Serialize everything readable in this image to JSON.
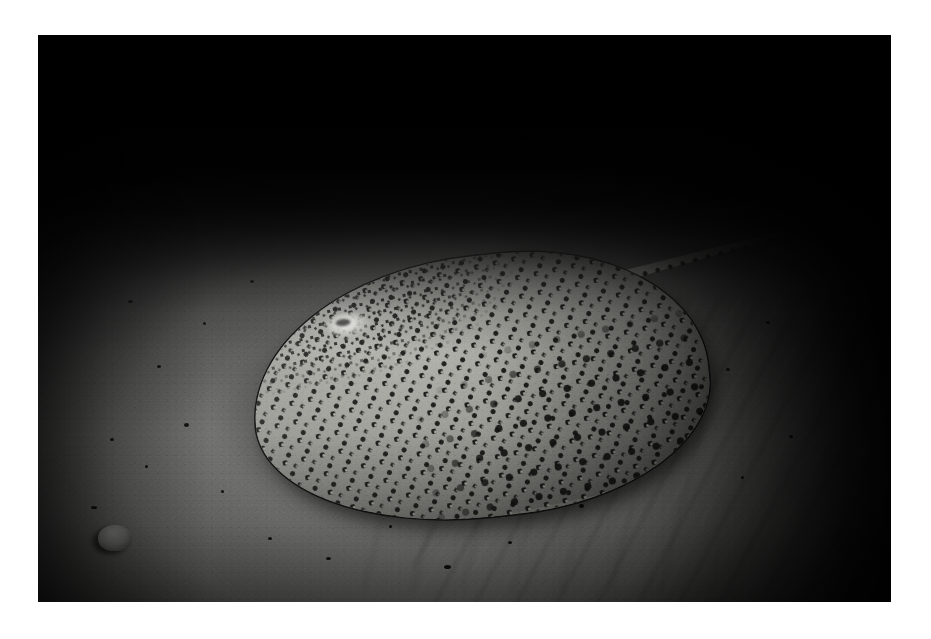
{
  "image": {
    "domain": "Natural-Image",
    "subject": "leopard whipray (honeycomb stingray) resting on sandy seabed",
    "scene": "underwater night photograph illuminated by strobe flash",
    "orientation": "landscape",
    "frame": {
      "canvas_width": 931,
      "canvas_height": 639,
      "border_color": "#ffffff",
      "photo_left": 38,
      "photo_top": 35,
      "photo_width": 853,
      "photo_height": 567
    },
    "palette": {
      "border": "#ffffff",
      "water_dark": "#000000",
      "sand_light": "#8f8f8c",
      "sand_mid": "#6e6e6c",
      "sand_shadow": "#2b2b2b",
      "ray_skin": "#a3a39d",
      "ray_spot": "#1b1b19",
      "highlight": "#ffffff"
    },
    "elements": {
      "background_label": "sandy seafloor",
      "water_label": "dark open water",
      "rubble_label": "rocky rubble ridge",
      "ripple_label": "sand ripples",
      "shell_label": "small shell on sand",
      "stick_label": "thin dark stick debris",
      "ray_label": "leopard whipray",
      "disc_label": "pectoral disc",
      "pattern_label": "leopard rosette spot pattern",
      "tail_label": "banded whip tail",
      "hotspot_label": "strobe specular highlight",
      "shadow_label": "cast shadow on sand"
    }
  }
}
